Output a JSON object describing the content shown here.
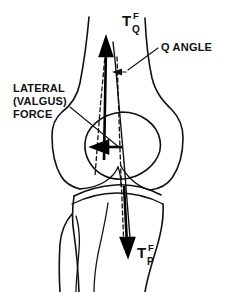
{
  "figure": {
    "background_color": "#ffffff",
    "line_color": "#111111",
    "width": 232,
    "height": 292
  },
  "labels": {
    "q_angle": "Q ANGLE",
    "lateral_force_line1": "LATERAL",
    "lateral_force_line2": "(VALGUS)",
    "lateral_force_line3": "FORCE"
  },
  "symbols": {
    "quadriceps_tension": {
      "base": "T",
      "superscript": "F",
      "subscript": "Q"
    },
    "patellar_tendon_tension": {
      "base": "T",
      "superscript": "F",
      "subscript": "P"
    }
  },
  "anatomy": {
    "parts": [
      "femur-shaft",
      "medial-femoral-condyle",
      "lateral-femoral-condyle",
      "patella",
      "tibial-plateau",
      "tibia-shaft",
      "fibula"
    ]
  },
  "vectors": [
    {
      "name": "quadriceps-force-vector",
      "direction": "up",
      "style": "solid-arrow"
    },
    {
      "name": "patellar-tendon-force-vector",
      "direction": "down",
      "style": "solid-arrow"
    },
    {
      "name": "lateral-valgus-force-vector",
      "direction": "left",
      "style": "thick-solid-arrow"
    },
    {
      "name": "mechanical-axis-reference",
      "direction": "vertical",
      "style": "dashed"
    }
  ]
}
